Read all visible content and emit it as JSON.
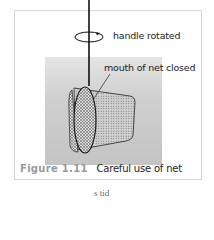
{
  "page": {
    "top_text": "fragment of page text",
    "bottom_text": "s      tid"
  },
  "figure": {
    "labels": {
      "handle": "handle rotated",
      "mouth": "mouth of net closed"
    },
    "caption": {
      "number": "Figure 1.11",
      "text": "Careful use of net"
    },
    "colors": {
      "caption_number": "#9a9a9a",
      "panel_top": "#e4e4e4",
      "panel_bottom": "#c4c4c4",
      "border": "#d6d6d6"
    }
  }
}
